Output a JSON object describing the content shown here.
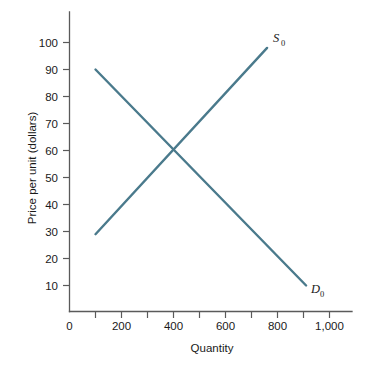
{
  "chart_data": {
    "type": "line",
    "title": "",
    "xlabel": "Quantity",
    "ylabel": "Price per unit (dollars)",
    "xlim": [
      0,
      1100
    ],
    "ylim": [
      0,
      105
    ],
    "grid": false,
    "legend_position": "inline-end-of-line",
    "x_tick_labels": [
      "0",
      "200",
      "400",
      "600",
      "800",
      "1,000"
    ],
    "x_tick_values": [
      0,
      200,
      400,
      600,
      800,
      1000
    ],
    "x_minor_tick_values": [
      100,
      300,
      500,
      700,
      900
    ],
    "y_tick_labels": [
      "10",
      "20",
      "30",
      "40",
      "50",
      "60",
      "70",
      "80",
      "90",
      "100"
    ],
    "y_tick_values": [
      10,
      20,
      30,
      40,
      50,
      60,
      70,
      80,
      90,
      100
    ],
    "series": [
      {
        "name": "S0",
        "label_text": "S",
        "label_subscript": "0",
        "kind": "supply",
        "color": "#4a7a8c",
        "points": [
          [
            100,
            29
          ],
          [
            760,
            98
          ]
        ]
      },
      {
        "name": "D0",
        "label_text": "D",
        "label_subscript": "0",
        "kind": "demand",
        "color": "#4a7a8c",
        "points": [
          [
            100,
            90
          ],
          [
            910,
            10
          ]
        ]
      }
    ],
    "equilibrium": {
      "quantity": 400,
      "price": 60
    }
  },
  "colors": {
    "curve": "#4a7a8c",
    "axis": "#5a5a5a",
    "text": "#1a1a1a",
    "background": "#ffffff"
  }
}
